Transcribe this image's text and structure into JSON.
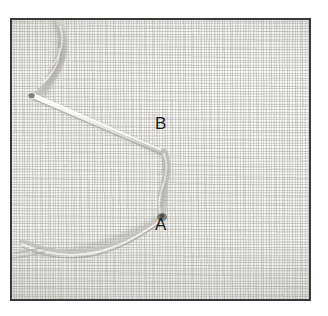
{
  "figure": {
    "kind": "photograph",
    "border_color": "#3a3a3a",
    "background_color": "#ffffff"
  },
  "fabric": {
    "name": "woven-linen-ground",
    "weave_type": "plain weave",
    "base_color": "#f7f7f5",
    "thread_color": "#b0aea8",
    "shadow_color": "#d8d6d0"
  },
  "labels": [
    {
      "id": "label-b",
      "text": "B",
      "color": "#1d1d1d",
      "marks": "upper point where the needle emerges / thread turns",
      "x": 143,
      "y": 95
    },
    {
      "id": "label-a",
      "text": "A",
      "color": "#1d1d1d",
      "marks": "lower point where the thread enters the fabric",
      "x": 143,
      "y": 196
    }
  ],
  "threads": [
    {
      "name": "needle-shaft",
      "kind": "straight-needle",
      "color": "#e8e8e6",
      "highlight": "#ffffff",
      "shadow": "#a8a6a0",
      "from": "upper-left",
      "to": "point-B"
    },
    {
      "name": "twisted-thread-top-left",
      "kind": "twisted-floss",
      "color": "#c9c7c1",
      "from": "top edge",
      "to": "needle eye"
    },
    {
      "name": "vertical-stitch-B-to-A",
      "kind": "working-stitch",
      "color": "#bfbdb6",
      "from": "point-B",
      "to": "point-A"
    },
    {
      "name": "thread-loop-bottom-left",
      "kind": "loose-loop",
      "color": "#c6c4be",
      "from": "point-A",
      "to": "left edge"
    }
  ],
  "entry_point": {
    "name": "thread-entry-at-A",
    "color": "#6e6c68"
  }
}
